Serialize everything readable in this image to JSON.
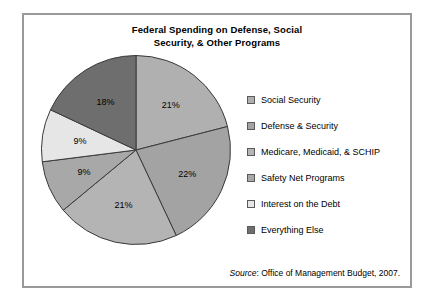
{
  "panel": {
    "border_color": "#9a9a9a",
    "background": "#ffffff"
  },
  "title": "Federal Spending on Defense, Social Security, & Other Programs",
  "title_line1": "Federal Spending on Defense, Social",
  "title_line2": "Security, & Other Programs",
  "source": {
    "prefix": "Source",
    "separator": ": ",
    "text": "Office of Management Budget, 2007."
  },
  "legend": {
    "items": [
      {
        "label": "Social Security",
        "color": "#b0b0b0"
      },
      {
        "label": "Defense & Security",
        "color": "#a3a3a3"
      },
      {
        "label": "Medicare, Medicaid, & SCHIP",
        "color": "#b4b4b4"
      },
      {
        "label": "Safety Net Programs",
        "color": "#a8a8a8"
      },
      {
        "label": "Interest on the Debt",
        "color": "#e6e6e6"
      },
      {
        "label": "Everything Else",
        "color": "#6e6e6e"
      }
    ]
  },
  "chart_data": {
    "type": "pie",
    "title": "Federal Spending on Defense, Social Security, & Other Programs",
    "xlabel": "",
    "ylabel": "",
    "legend_position": "right",
    "grid": false,
    "start_angle_deg": 0,
    "direction": "clockwise",
    "categories": [
      "Social Security",
      "Defense & Security",
      "Medicare, Medicaid, & SCHIP",
      "Safety Net Programs",
      "Interest on the Debt",
      "Everything Else"
    ],
    "values": [
      21,
      22,
      21,
      9,
      9,
      18
    ],
    "data_labels": [
      "21%",
      "22%",
      "21%",
      "9%",
      "9%",
      "18%"
    ],
    "colors": [
      "#b0b0b0",
      "#a3a3a3",
      "#b4b4b4",
      "#a8a8a8",
      "#e6e6e6",
      "#6e6e6e"
    ],
    "units": "percent",
    "total": 100,
    "source": "Source: Office of Management Budget, 2007."
  }
}
